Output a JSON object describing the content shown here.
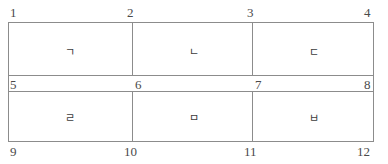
{
  "figure": {
    "type": "node-numbered-mesh-diagram",
    "cells": [
      {
        "id": "r1c1",
        "label": "ㄱ"
      },
      {
        "id": "r1c2",
        "label": "ㄴ"
      },
      {
        "id": "r1c3",
        "label": "ㄷ"
      },
      {
        "id": "r2c1",
        "label": "ㄹ"
      },
      {
        "id": "r2c2",
        "label": "ㅁ"
      },
      {
        "id": "r2c3",
        "label": "ㅂ"
      }
    ],
    "nodes": [
      {
        "id": "n1",
        "label": "1"
      },
      {
        "id": "n2",
        "label": "2"
      },
      {
        "id": "n3",
        "label": "3"
      },
      {
        "id": "n4",
        "label": "4"
      },
      {
        "id": "n5",
        "label": "5"
      },
      {
        "id": "n6",
        "label": "6"
      },
      {
        "id": "n7",
        "label": "7"
      },
      {
        "id": "n8",
        "label": "8"
      },
      {
        "id": "n9",
        "label": "9"
      },
      {
        "id": "n10",
        "label": "10"
      },
      {
        "id": "n11",
        "label": "11"
      },
      {
        "id": "n12",
        "label": "12"
      }
    ],
    "colors": {
      "line": "#8c8c8c",
      "text": "#4a4a4a",
      "glyph": "#3c3c3c",
      "background": "#ffffff"
    }
  }
}
